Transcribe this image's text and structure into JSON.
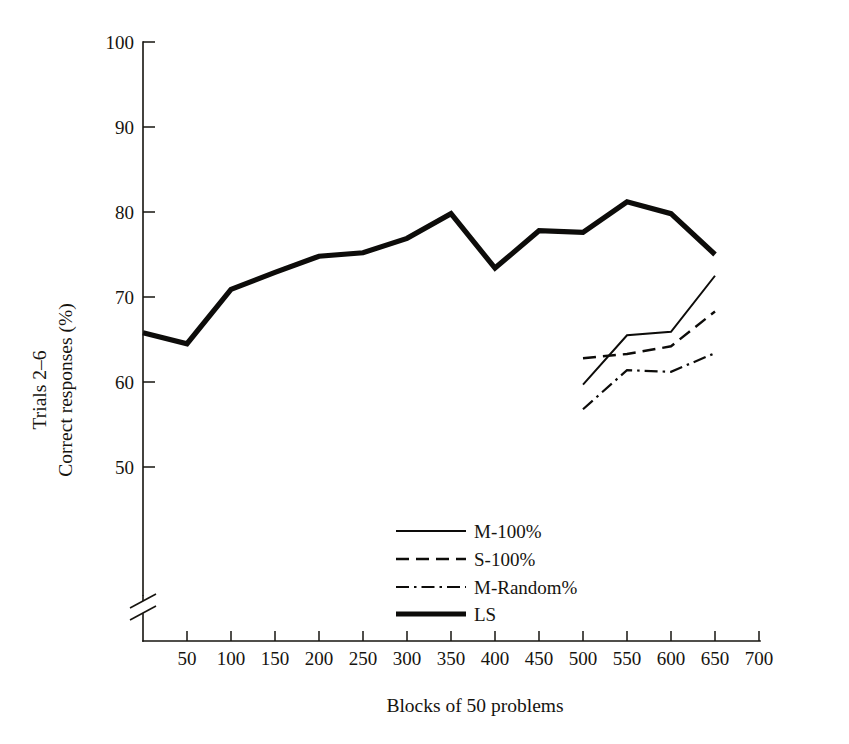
{
  "chart_data": {
    "type": "line",
    "title": "",
    "xlabel": "Blocks of 50 problems",
    "ylabel_line1": "Trials 2–6",
    "ylabel_line2": "Correct responses (%)",
    "xlim": [
      0,
      700
    ],
    "ylim": [
      46,
      100
    ],
    "y_axis_break_below": 50,
    "grid": false,
    "legend_position": "lower-center",
    "xticks": [
      50,
      100,
      150,
      200,
      250,
      300,
      350,
      400,
      450,
      500,
      550,
      600,
      650,
      700
    ],
    "xtick_labels": [
      "50",
      "100",
      "150",
      "200",
      "250",
      "300",
      "350",
      "400",
      "450",
      "500",
      "550",
      "600",
      "650",
      "700"
    ],
    "yticks": [
      50,
      60,
      70,
      80,
      90,
      100
    ],
    "ytick_labels": [
      "50",
      "60",
      "70",
      "80",
      "90",
      "100"
    ],
    "series": [
      {
        "name": "M-100%",
        "style": "solid-thin",
        "x": [
          500,
          550,
          600,
          650
        ],
        "values": [
          59.7,
          65.5,
          65.9,
          72.5
        ]
      },
      {
        "name": "S-100%",
        "style": "dashed",
        "x": [
          500,
          550,
          600,
          650
        ],
        "values": [
          62.8,
          63.3,
          64.2,
          68.3
        ]
      },
      {
        "name": "M-Random%",
        "style": "dash-dot",
        "x": [
          500,
          550,
          600,
          650
        ],
        "values": [
          56.8,
          61.4,
          61.2,
          63.4
        ]
      },
      {
        "name": "LS",
        "style": "solid-thick",
        "x": [
          0,
          50,
          100,
          150,
          200,
          250,
          300,
          350,
          400,
          450,
          500,
          550,
          600,
          650
        ],
        "values": [
          65.8,
          64.5,
          70.9,
          72.9,
          74.8,
          75.2,
          76.9,
          79.8,
          73.4,
          77.8,
          77.6,
          81.2,
          79.8,
          75.0
        ]
      }
    ]
  },
  "legend": {
    "entries": [
      {
        "label": "M-100%",
        "style": "solid-thin"
      },
      {
        "label": "S-100%",
        "style": "dashed"
      },
      {
        "label": "M-Random%",
        "style": "dash-dot"
      },
      {
        "label": "LS",
        "style": "solid-thick"
      }
    ]
  }
}
